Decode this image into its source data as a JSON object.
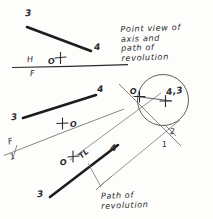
{
  "figure": {
    "kind": "descriptive-geometry-drawing",
    "title_hidden": "Revolution of a line about an axis",
    "ink_color": "#2b2b2b",
    "thin_color": "#7a7a78",
    "background": "#fdfdfc"
  },
  "annotations": {
    "note_point_view": "Point view of\naxis and\npath of\nrevolution",
    "note_path": "Path of\nrevolution",
    "true_length": "TL"
  },
  "labels": {
    "top_view": {
      "p3": "3",
      "p4": "4",
      "axis_o": "O"
    },
    "front_view": {
      "p3": "3",
      "p4": "4",
      "axis_o": "O"
    },
    "aux_view_1": {
      "p3": "3",
      "p4": "4",
      "axis_o": "O"
    },
    "aux_view_2": {
      "point_43": "4,3",
      "axis_o": "O"
    }
  },
  "fold_lines": {
    "hf": {
      "upper": "H",
      "lower": "F"
    },
    "f1": {
      "upper": "F",
      "lower": "1"
    },
    "one_two": {
      "upper": "2",
      "lower": "1"
    }
  },
  "geometry": {
    "hf_reference_line": {
      "x1": 12,
      "y1": 67,
      "x2": 128,
      "y2": 64
    },
    "f1_reference_line": {
      "x1": 4,
      "y1": 155,
      "x2": 124,
      "y2": 109
    },
    "one_two_reference_line": {
      "x1": 120,
      "y1": 85,
      "x2": 180,
      "y2": 145
    },
    "top_view_line_34": {
      "x1": 27,
      "y1": 27,
      "x2": 91,
      "y2": 51
    },
    "front_view_line_34": {
      "x1": 23,
      "y1": 118,
      "x2": 96,
      "y2": 96
    },
    "aux_view_line_34": {
      "x1": 50,
      "y1": 196,
      "x2": 117,
      "y2": 146
    },
    "revolution_circle": {
      "cx": 163,
      "cy": 100,
      "r": 25
    },
    "circle_center_mark": {
      "x": 163,
      "y": 100
    },
    "axis_mark_top": {
      "x": 60,
      "y": 58
    },
    "axis_mark_front": {
      "x": 63,
      "y": 124
    },
    "axis_mark_aux": {
      "x": 73,
      "y": 157
    },
    "axis_mark_pointview": {
      "x": 139,
      "y": 97
    }
  }
}
